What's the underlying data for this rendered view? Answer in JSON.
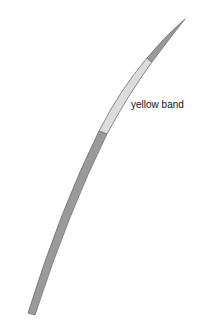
{
  "diagram": {
    "annotations": [
      {
        "text": "yellow band"
      }
    ],
    "colors": {
      "stem_fill": "#9a9a9a",
      "band_fill": "#dcdcdc",
      "outline": "#6e6e6e",
      "background": "#ffffff"
    }
  }
}
